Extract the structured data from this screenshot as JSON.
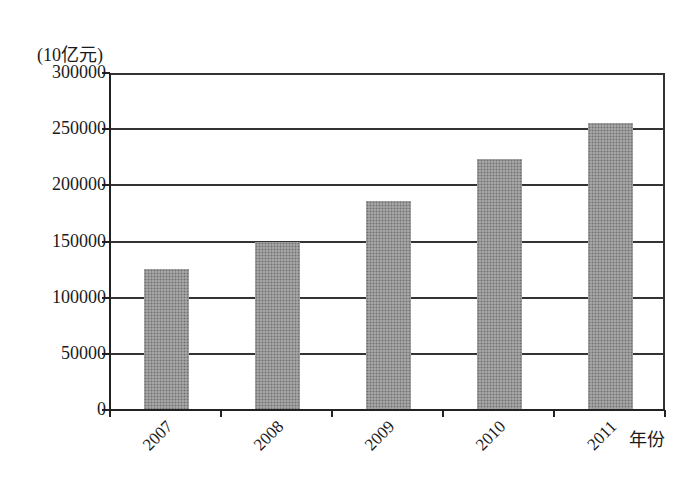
{
  "chart_data": {
    "type": "bar",
    "title": "",
    "ylabel": "(10亿元)",
    "xlabel": "年份",
    "categories": [
      "2007",
      "2008",
      "2009",
      "2010",
      "2011"
    ],
    "values": [
      125400,
      150000,
      186000,
      223300,
      255300
    ],
    "ylim": [
      0,
      300000
    ],
    "yticks": [
      "0",
      "50000",
      "100000",
      "150000",
      "200000",
      "250000",
      "300000"
    ],
    "grid": true,
    "legend": null,
    "bar_color": "#a4a4a4"
  },
  "labels": {
    "unit": "(10亿元)",
    "x_title": "年份"
  }
}
